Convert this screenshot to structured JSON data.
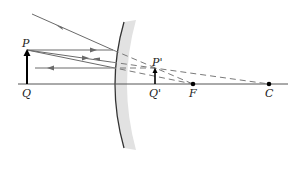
{
  "diagram": {
    "labels": {
      "object_top": "P",
      "object_base": "Q",
      "image_top": "P'",
      "image_base": "Q'",
      "focal_point": "F",
      "center_of_curvature": "C"
    },
    "colors": {
      "ray": "#6a6a6a",
      "axis": "#555555",
      "mirror_line": "#333333",
      "mirror_shade": "#e2e2e2",
      "object_arrow": "#000000"
    },
    "points": {
      "Q": [
        27,
        84
      ],
      "P": [
        27,
        50
      ],
      "Q_prime": [
        155,
        84
      ],
      "P_prime": [
        155,
        68
      ],
      "F": [
        193,
        84
      ],
      "C": [
        269,
        84
      ]
    }
  }
}
